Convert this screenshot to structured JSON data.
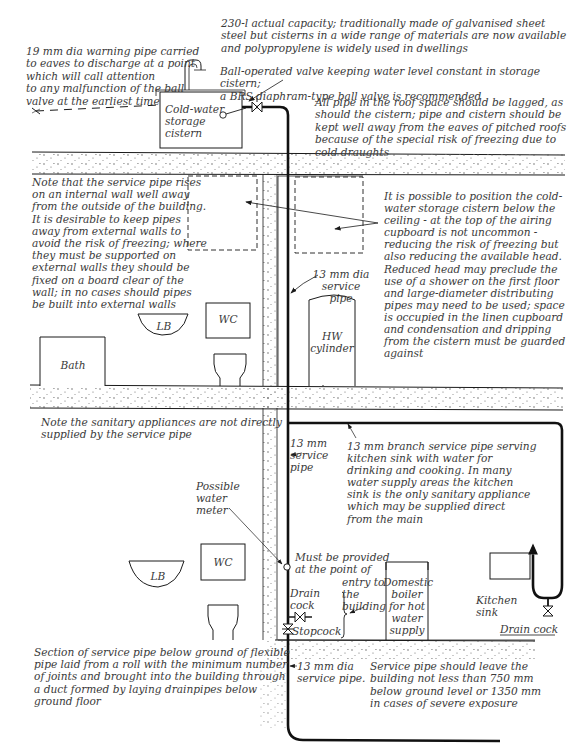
{
  "diagram": {
    "type": "cold-water-supply-section",
    "colors": {
      "line": "#1a1a1a",
      "text": "#3a3a3a",
      "screed_dots": "#555555",
      "background": "#ffffff"
    },
    "notes": {
      "warning_pipe": "19 mm dia warning pipe carried\nto eaves to discharge at a point\nwhich will call attention\nto any malfunction of the ball\nvalve at the earliest time",
      "cistern_capacity": "230-l actual capacity; traditionally made of galvanised sheet\nsteel but cisterns in a wide range of materials are now available\nand polypropylene is widely used in dwellings",
      "ball_valve": "Ball-operated valve keeping water level constant in storage cistern;\na BRS diaphram-type ball valve is recommended",
      "roof_lagging": "All pipe in the roof space should be lagged, as\nshould the cistern; pipe and cistern should be\nkept well away from the eaves of pitched roofs\nbecause of the special risk of freezing due to\ncold draughts",
      "internal_wall": "Note that the service pipe rises\non an internal wall well away\nfrom the outside of the building.\nIt is desirable to keep pipes\naway  from external walls to\navoid the risk of freezing; where\nthey must be supported on\nexternal walls they should be\nfixed on a board clear of the\nwall; in no cases should pipes\nbe built into external walls",
      "cistern_position": "It is possible to position the cold-\nwater storage cistern below the\nceiling - at the top of the airing\ncupboard is not uncommon -\nreducing the risk of freezing but\nalso reducing the available head.\nReduced head may preclude the\nuse of a shower on the first floor\nand large-diameter distributing\npipes may need to be used; space\nis occupied in the linen cupboard\nand condensation and dripping\nfrom the cistern must be guarded\nagainst",
      "sanitary_note": "Note the sanitary appliances are not directly\nsupplied by the service pipe",
      "branch_pipe": "13 mm branch service pipe serving\nkitchen sink  with water for\ndrinking and cooking. In many\nwater supply areas the kitchen\nsink is the only sanitary appliance\nwhich may be supplied direct\nfrom the main",
      "below_ground": "Section of service pipe below ground of flexible\npipe laid from a roll with the minimum number\nof joints and brought into the building through\na duct formed by laying drainpipes below\nground floor",
      "leave_building": "Service pipe should leave the\nbuilding not less than 750 mm\nbelow ground level or 1350 mm\nin cases of severe exposure"
    },
    "labels": {
      "cistern": "Cold-water\nstorage\ncistern",
      "service_pipe_upper": "13 mm dia\nservice pipe",
      "hw_cylinder": "HW\ncylinder",
      "lb_upper": "LB",
      "wc_upper": "WC",
      "bath": "Bath",
      "service_pipe_mid": "13 mm\nservice\npipe",
      "water_meter": "Possible\nwater\nmeter",
      "lb_lower": "LB",
      "wc_lower": "WC",
      "must_be_provided": "Must be provided\nat the point of",
      "entry_to_building": "entry to\nthe\nbuilding",
      "drain_cock_left": "Drain\ncock",
      "stopcock": "Stopcock",
      "boiler": "Domestic\nboiler\nfor hot\nwater\nsupply",
      "kitchen_sink": "Kitchen\nsink",
      "drain_cock_right": "Drain cock",
      "service_pipe_lower": "13 mm dia\nservice pipe."
    }
  }
}
